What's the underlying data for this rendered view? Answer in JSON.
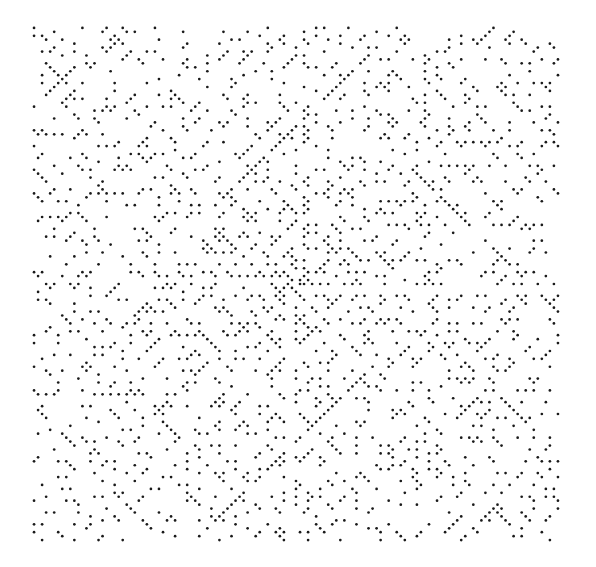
{
  "figure": {
    "type": "ulam-prime-spiral",
    "grid_size": 131,
    "start_value": 1,
    "center_px": [
      296,
      284
    ],
    "step_px": [
      4.03,
      3.94
    ],
    "dot_radius_px": 1.35,
    "dot_color": "#1a1a1a",
    "background_color": "#ffffff"
  }
}
